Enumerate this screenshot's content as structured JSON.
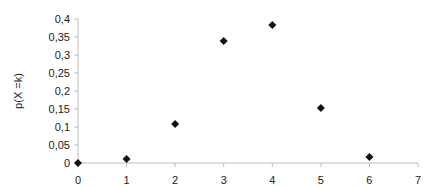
{
  "chart_data": {
    "type": "scatter",
    "title": "",
    "xlabel": "",
    "ylabel": "p(X =k)",
    "xlim": [
      0,
      7
    ],
    "ylim": [
      0,
      0.4
    ],
    "x_ticks": [
      0,
      1,
      2,
      3,
      4,
      5,
      6,
      7
    ],
    "x_tick_labels": [
      "0",
      "1",
      "2",
      "3",
      "4",
      "5",
      "6",
      "7"
    ],
    "y_ticks": [
      0,
      0.05,
      0.1,
      0.15,
      0.2,
      0.25,
      0.3,
      0.35,
      0.4
    ],
    "y_tick_labels": [
      "0",
      "0,05",
      "0,1",
      "0,15",
      "0,2",
      "0,25",
      "0,3",
      "0,35",
      "0,4"
    ],
    "grid": false,
    "legend": null,
    "marker": "diamond",
    "marker_color": "#111111",
    "series": [
      {
        "name": "p(X =k)",
        "x": [
          0,
          1,
          2,
          3,
          4,
          5,
          6
        ],
        "values": [
          0.0,
          0.011,
          0.108,
          0.339,
          0.383,
          0.153,
          0.017
        ]
      }
    ]
  },
  "colors": {
    "axis": "#bdbdbd",
    "marker": "#111111",
    "text": "#222222"
  }
}
